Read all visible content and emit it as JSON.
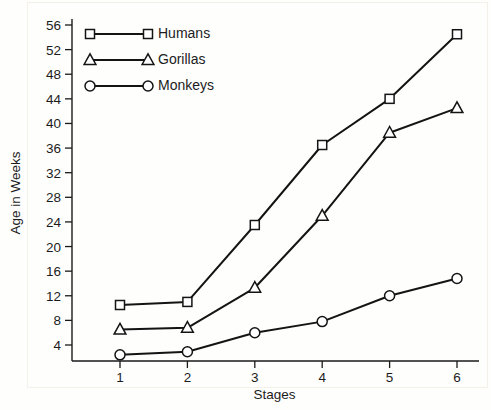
{
  "chart_data": {
    "type": "line",
    "title": "",
    "xlabel": "Stages",
    "ylabel": "Age in Weeks",
    "categories": [
      "1",
      "2",
      "3",
      "4",
      "5",
      "6"
    ],
    "x": [
      1,
      2,
      3,
      4,
      5,
      6
    ],
    "xlim": [
      0.55,
      6.45
    ],
    "ylim": [
      0,
      57
    ],
    "grid": false,
    "legend_position": "top-left",
    "y_ticks": [
      4,
      8,
      12,
      16,
      20,
      24,
      28,
      32,
      36,
      40,
      44,
      48,
      52,
      56
    ],
    "y_tick_labels": [
      "4",
      "8",
      "12",
      "16",
      "20",
      "24",
      "28",
      "32",
      "36",
      "40",
      "44",
      "48",
      "52",
      "56"
    ],
    "x_ticks": [
      1,
      2,
      3,
      4,
      5,
      6
    ],
    "x_tick_labels": [
      "1",
      "2",
      "3",
      "4",
      "5",
      "6"
    ],
    "series": [
      {
        "name": "Humans",
        "marker": "square",
        "values": [
          10.5,
          11,
          23.5,
          36.5,
          44,
          54.5
        ]
      },
      {
        "name": "Gorillas",
        "marker": "triangle",
        "values": [
          6.5,
          6.8,
          13.3,
          25,
          38.5,
          42.5
        ]
      },
      {
        "name": "Monkeys",
        "marker": "circle",
        "values": [
          2.4,
          2.9,
          6,
          7.8,
          12,
          14.8
        ]
      }
    ]
  },
  "legend": {
    "entries": [
      {
        "label": "Humans",
        "marker": "square"
      },
      {
        "label": "Gorillas",
        "marker": "triangle"
      },
      {
        "label": "Monkeys",
        "marker": "circle"
      }
    ]
  },
  "colors": {
    "ink": "#141414",
    "background": "#fefefd",
    "marker_fill": "#ffffff"
  }
}
